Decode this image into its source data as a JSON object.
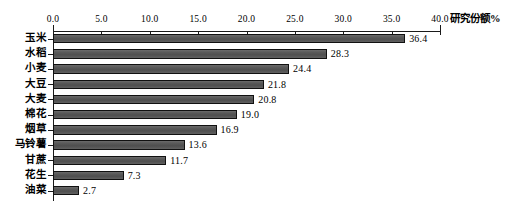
{
  "chart_data": {
    "type": "bar",
    "orientation": "horizontal",
    "title": "",
    "xlabel": "研究份额%",
    "ylabel": "",
    "categories": [
      "玉米",
      "水稻",
      "小麦",
      "大豆",
      "大麦",
      "棉花",
      "烟草",
      "马铃薯",
      "甘蔗",
      "花生",
      "油菜"
    ],
    "values": [
      36.4,
      28.3,
      24.4,
      21.8,
      20.8,
      19.0,
      16.9,
      13.6,
      11.7,
      7.3,
      2.7
    ],
    "value_labels": [
      "36.4",
      "28.3",
      "24.4",
      "21.8",
      "20.8",
      "19.0",
      "16.9",
      "13.6",
      "11.7",
      "7.3",
      "2.7"
    ],
    "xlim": [
      0.0,
      40.0
    ],
    "xticks": [
      0.0,
      5.0,
      10.0,
      15.0,
      20.0,
      25.0,
      30.0,
      35.0,
      40.0
    ],
    "xtick_labels": [
      "0.0",
      "5.0",
      "10.0",
      "15.0",
      "20.0",
      "25.0",
      "30.0",
      "35.0",
      "40.0"
    ],
    "axis_position": "top",
    "grid": false,
    "legend": false,
    "bar_color": "#555555",
    "bar_edge_color": "#111111",
    "background": "#ffffff",
    "text_color": "#000000"
  }
}
